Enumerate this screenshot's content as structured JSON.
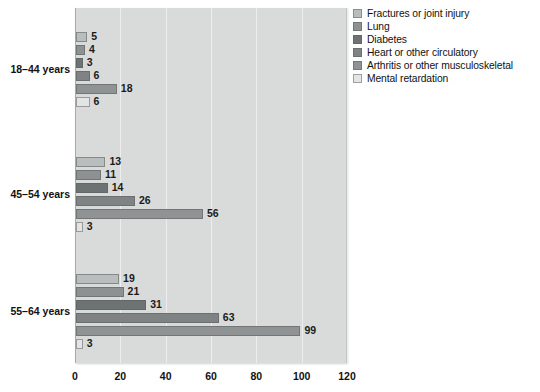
{
  "chart_data": {
    "type": "bar",
    "orientation": "horizontal",
    "title": "",
    "subtitle": "",
    "xlabel": "",
    "ylabel": "",
    "xlim": [
      0,
      120
    ],
    "ylim": null,
    "grid": true,
    "legend_position": "top-right",
    "categories": [
      "18–44 years",
      "45–54 years",
      "55–64 years"
    ],
    "xticks": [
      0,
      20,
      40,
      60,
      80,
      100,
      120
    ],
    "xtick_labels": [
      "0",
      "20",
      "40",
      "60",
      "80",
      "100",
      "120"
    ],
    "series": [
      {
        "name": "Fractures or joint injury",
        "color": "#b9bdbd",
        "values": [
          5,
          13,
          19
        ]
      },
      {
        "name": "Lung",
        "color": "#8d9192",
        "values": [
          4,
          11,
          21
        ]
      },
      {
        "name": "Diabetes",
        "color": "#6d7273",
        "values": [
          3,
          14,
          31
        ]
      },
      {
        "name": "Heart or other circulatory",
        "color": "#7f8384",
        "values": [
          6,
          26,
          63
        ]
      },
      {
        "name": "Arthritis or other musculoskeletal",
        "color": "#8f9394",
        "values": [
          18,
          56,
          99
        ]
      },
      {
        "name": "Mental retardation",
        "color": "#e3e5e5",
        "values": [
          6,
          3,
          3
        ]
      }
    ]
  },
  "legend": {
    "items": [
      {
        "label": "Fractures or joint injury",
        "color": "#b9bdbd"
      },
      {
        "label": "Lung",
        "color": "#8d9192"
      },
      {
        "label": "Diabetes",
        "color": "#6d7273"
      },
      {
        "label": "Heart or other circulatory",
        "color": "#7f8384"
      },
      {
        "label": "Arthritis or other musculoskeletal",
        "color": "#8f9394"
      },
      {
        "label": "Mental retardation",
        "color": "#e3e5e5"
      }
    ]
  },
  "axis": {
    "x_tick_labels": [
      "0",
      "20",
      "40",
      "60",
      "80",
      "100",
      "120"
    ],
    "y_category_labels": [
      "18–44 years",
      "45–54 years",
      "55–64 years"
    ]
  },
  "colors": {
    "plot_background": "#d9dbdb",
    "gridline": "#eceeee",
    "text": "#111111",
    "page_background": "#ffffff"
  }
}
